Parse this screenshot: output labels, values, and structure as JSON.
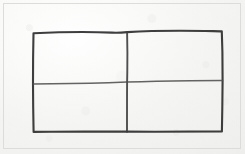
{
  "image": {
    "kind": "hand-drawn-diagram-photo",
    "width": 245,
    "height": 154,
    "description": "Hand-drawn rectangle divided into four quadrants by one vertical and one horizontal line, on light gray paper",
    "alt_text": "A rectangle split into a 2 by 2 grid of four equal boxes, drawn by hand in dark pen on paper"
  },
  "colors": {
    "paper_light": "#f7f7f5",
    "paper_mid": "#f1f1ef",
    "paper_dark": "#eeeeec",
    "scan_frame": "#dcdcda",
    "ink_outer": "#2e2e2e",
    "ink_inner": "#4a4a4a",
    "ink_light": "#5e5e5e"
  },
  "figure": {
    "title": "",
    "shape_name": "four-quadrant-grid",
    "cell_count": 4,
    "rows": 2,
    "columns": 2,
    "bounds": {
      "left": 33,
      "top": 32,
      "right": 222,
      "bottom": 132
    },
    "dividers": {
      "vertical_x": 127,
      "horizontal_y_left": 83,
      "horizontal_y_right": 81
    },
    "stroke_widths": {
      "outer_border": 2.1,
      "vertical_divider": 1.9,
      "horizontal_divider": 1.5
    },
    "paths": {
      "outer_rect": "M 33.5 33.2 C 60 32.0, 88 31.6, 112 32.6 C 118 32.9, 122 32.6, 127.2 32.1 C 150 30.8, 180 30.6, 205 31.0 C 213 31.2, 218 31.2, 221.8 31.4 L 222.4 52 L 222.6 80.6 L 222.3 108 L 221.9 131.4 C 205 131.7, 180 131.8, 155 131.8 C 143 131.8, 134 131.7, 127.0 131.6 C 105 131.5, 75 131.6, 51 131.8 C 43 131.9, 38 131.9, 33.6 131.9 L 33.2 108 L 33.0 84.0 L 33.1 58 Z",
      "vertical_divider": "M 127.1 32.2 C 127.4 45, 127.5 60, 127.3 72 C 127.2 76, 127.2 79, 127.1 82.0 C 127.0 95, 127.0 112, 127.0 122 C 127.0 127, 127.0 130, 127.0 131.7",
      "horizontal_divider_left": "M 33.2 84.0 C 50 83.7, 70 83.5, 90 83.2 C 104 83.0, 116 82.6, 127.1 82.1",
      "horizontal_divider_right": "M 127.1 82.1 C 145 81.5, 168 81.0, 190 80.7 C 203 80.5, 213 80.5, 222.5 80.5"
    },
    "cells": [
      {
        "name": "top-left-cell",
        "row": 1,
        "column": 1,
        "label": ""
      },
      {
        "name": "top-right-cell",
        "row": 1,
        "column": 2,
        "label": ""
      },
      {
        "name": "bottom-left-cell",
        "row": 2,
        "column": 1,
        "label": ""
      },
      {
        "name": "bottom-right-cell",
        "row": 2,
        "column": 2,
        "label": ""
      }
    ]
  }
}
